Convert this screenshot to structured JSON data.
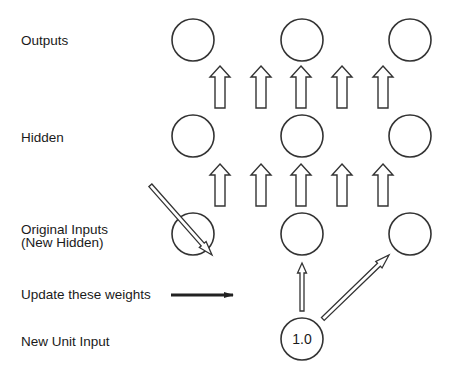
{
  "diagram": {
    "type": "cascade-correlation network schematic",
    "row_labels": {
      "outputs": "Outputs",
      "hidden": "Hidden",
      "original_inputs_line1": "Original Inputs",
      "original_inputs_line2": "(New Hidden)",
      "update_weights": "Update these weights",
      "new_unit_input": "New Unit Input"
    },
    "layers": [
      {
        "name": "outputs",
        "node_count": 3
      },
      {
        "name": "hidden",
        "node_count": 3
      },
      {
        "name": "original-inputs",
        "node_count": 3
      },
      {
        "name": "new-unit-input",
        "node_count": 1,
        "node_label": "1.0"
      }
    ],
    "connections": {
      "hidden_to_outputs_arrows": 5,
      "inputs_to_hidden_arrows": 5,
      "new_unit_to_inputs_arrows": 3
    },
    "colors": {
      "stroke": "#333333",
      "text": "#1a1a1a",
      "background": "#ffffff"
    }
  }
}
